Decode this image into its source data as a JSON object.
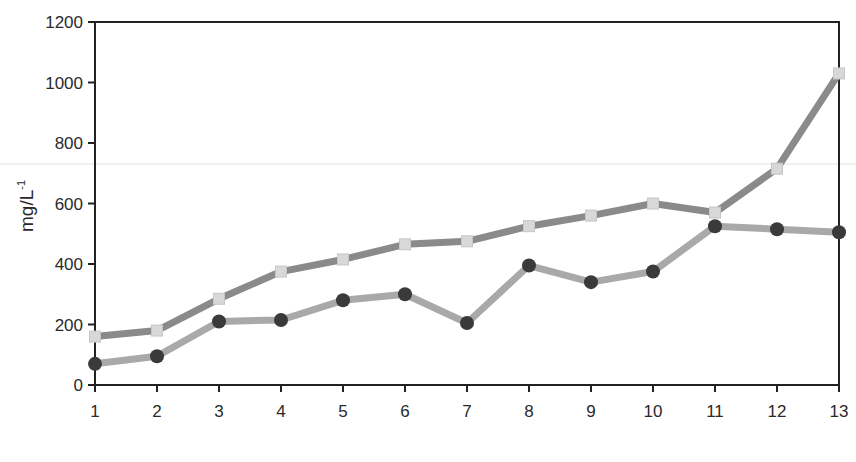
{
  "chart_data": {
    "type": "line",
    "title": "",
    "xlabel": "",
    "ylabel": "mg/L",
    "ylabel_superscript": "-1",
    "x": [
      1,
      2,
      3,
      4,
      5,
      6,
      7,
      8,
      9,
      10,
      11,
      12,
      13
    ],
    "x_tick_labels": [
      "1",
      "2",
      "3",
      "4",
      "5",
      "6",
      "7",
      "8",
      "9",
      "10",
      "11",
      "12",
      "13"
    ],
    "y_tick_labels": [
      "0",
      "200",
      "400",
      "600",
      "800",
      "1000",
      "1200"
    ],
    "ylim": [
      0,
      1200
    ],
    "xlim": [
      1,
      13
    ],
    "grid": false,
    "legend": null,
    "series": [
      {
        "name": "series-squares",
        "marker": "square",
        "line_color": "#8a8a8a",
        "marker_color": "#d8d8d8",
        "values": [
          160,
          180,
          285,
          375,
          415,
          465,
          475,
          525,
          560,
          600,
          570,
          715,
          1030
        ]
      },
      {
        "name": "series-circles",
        "marker": "circle",
        "line_color": "#a9a9a9",
        "marker_color": "#3a3a3a",
        "values": [
          70,
          95,
          210,
          215,
          280,
          300,
          205,
          395,
          340,
          375,
          525,
          515,
          505
        ]
      }
    ]
  }
}
